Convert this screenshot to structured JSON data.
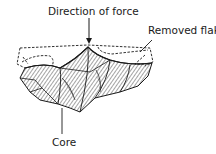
{
  "diagram": {
    "labels": {
      "force": "Direction of force",
      "flake": "Removed flake",
      "core": "Core"
    },
    "colors": {
      "ink": "#1a1a1a",
      "background": "#ffffff"
    }
  }
}
